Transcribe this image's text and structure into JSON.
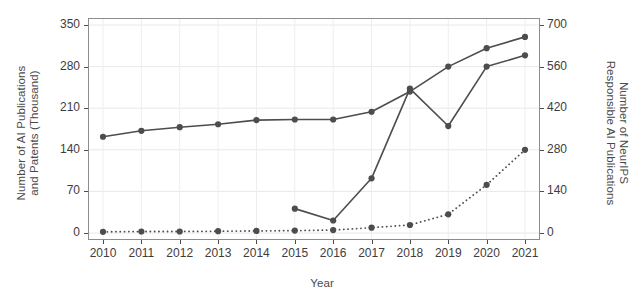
{
  "chart_data": {
    "type": "line",
    "title": "",
    "xlabel": "Year",
    "ylabel": "Number of AI Publications and Patents (Thousand)",
    "ylabel_right": "Number of NeurIPS Responsible AI Publications",
    "x": [
      2010,
      2011,
      2012,
      2013,
      2014,
      2015,
      2016,
      2017,
      2018,
      2019,
      2020,
      2021
    ],
    "categories": [
      "2010",
      "2011",
      "2012",
      "2013",
      "2014",
      "2015",
      "2016",
      "2017",
      "2018",
      "2019",
      "2020",
      "2021"
    ],
    "ylim": [
      0,
      350
    ],
    "yticks": [
      0,
      70,
      140,
      210,
      280,
      350
    ],
    "ytick_labels": [
      "0",
      "70",
      "140",
      "210",
      "280",
      "350"
    ],
    "ylim_right": [
      0,
      700
    ],
    "yticks_right": [
      0,
      140,
      280,
      420,
      560,
      700
    ],
    "ytick_labels_right": [
      "0",
      "140",
      "280",
      "420",
      "560",
      "700"
    ],
    "grid": true,
    "legend": "none",
    "series": [
      {
        "name": "AI Publications",
        "axis": "left",
        "style": "solid",
        "color": "#4d4d4d",
        "values": [
          162,
          172,
          178,
          183,
          190,
          191,
          191,
          204,
          238,
          280,
          311,
          330
        ]
      },
      {
        "name": "AI Patents",
        "axis": "left",
        "style": "solid",
        "color": "#4d4d4d",
        "values": [
          null,
          null,
          null,
          null,
          null,
          41,
          21,
          92,
          243,
          180,
          280,
          299
        ]
      },
      {
        "name": "NeurIPS Responsible AI Publications",
        "axis": "right",
        "style": "dotted",
        "color": "#4d4d4d",
        "values": [
          4,
          5,
          5,
          6,
          7,
          8,
          10,
          18,
          27,
          63,
          162,
          280
        ]
      }
    ]
  },
  "axes": {
    "left_title": "Number of AI Publications\nand Patents (Thousand)",
    "right_title": "Number of NeurIPS\nResponsible AI Publications",
    "x_title": "Year"
  }
}
